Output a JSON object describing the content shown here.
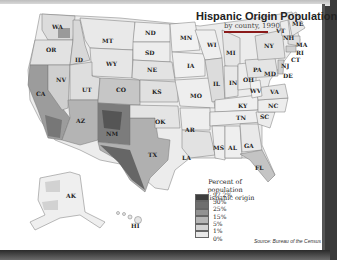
{
  "map": {
    "title": "Hispanic Origin Population",
    "subtitle": "by county, 1990",
    "source": "Source:  Bureau of the Census",
    "state_labels": [
      "WA",
      "OR",
      "CA",
      "NV",
      "ID",
      "MT",
      "WY",
      "UT",
      "AZ",
      "CO",
      "NM",
      "ND",
      "SD",
      "NE",
      "KS",
      "OK",
      "TX",
      "MN",
      "IA",
      "MO",
      "AR",
      "LA",
      "WI",
      "IL",
      "MI",
      "IN",
      "OH",
      "KY",
      "TN",
      "MS",
      "AL",
      "GA",
      "FL",
      "SC",
      "NC",
      "VA",
      "WV",
      "PA",
      "NY",
      "VT",
      "NH",
      "ME",
      "MA",
      "RI",
      "CT",
      "NJ",
      "DE",
      "MD",
      "AK",
      "HI"
    ]
  },
  "legend": {
    "title_line1": "Percent of population",
    "title_line2": "of Hispanic origin",
    "classes": [
      {
        "label": "97.2%",
        "color": "#3d3d3d"
      },
      {
        "label": "50%",
        "color": "#6e6e6e"
      },
      {
        "label": "25%",
        "color": "#929292"
      },
      {
        "label": "15%",
        "color": "#b5b5b5"
      },
      {
        "label": "5%",
        "color": "#d2d2d2"
      },
      {
        "label": "1%",
        "color": "#e8e8e8"
      },
      {
        "label": "0%",
        "color": "#f8f8f8"
      }
    ]
  },
  "colors": {
    "title_rule": "#8b1a1a",
    "frame": "#3a3a3a"
  }
}
